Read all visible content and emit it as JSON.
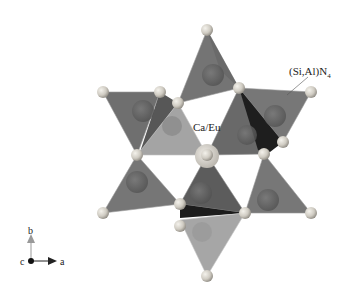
{
  "figure": {
    "labels": {
      "tetrahedron": "(Si,Al)N",
      "tetrahedron_subscript": "4",
      "cation": "Ca/Eu"
    },
    "axes": {
      "b": "b",
      "c": "c",
      "a": "a"
    }
  },
  "colors": {
    "background": "#ffffff",
    "tetra_dark": "#6e6e6e",
    "tetra_mid": "#7f7f7f",
    "tetra_light": "#a8a8a8",
    "tetra_shadow": "#1e1e1e",
    "atom_light": "#d9d6cf",
    "atom_center": "#6a6a6a"
  }
}
